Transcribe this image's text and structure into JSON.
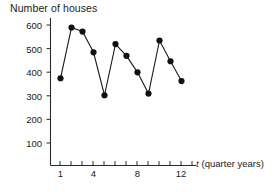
{
  "chart_data": {
    "type": "line",
    "title": "Number of houses",
    "xlabel": "t (quarter years)",
    "xlabel_variable": "t",
    "xlabel_unit": "(quarter years)",
    "ylabel": "Number of houses",
    "x": [
      1,
      2,
      3,
      4,
      5,
      6,
      7,
      8,
      9,
      10,
      11,
      12
    ],
    "values": [
      365,
      580,
      563,
      475,
      293,
      510,
      460,
      390,
      300,
      525,
      437,
      353
    ],
    "xlim": [
      0,
      13
    ],
    "ylim": [
      0,
      640
    ],
    "xticks": [
      1,
      2,
      3,
      4,
      5,
      6,
      7,
      8,
      9,
      10,
      11,
      12,
      13
    ],
    "xtick_labels": [
      "1",
      "",
      "",
      "4",
      "",
      "",
      "",
      "8",
      "",
      "",
      "",
      "12",
      ""
    ],
    "yticks": [
      100,
      200,
      300,
      400,
      500,
      600
    ],
    "ytick_labels": [
      "100",
      "200",
      "300",
      "400",
      "500",
      "600"
    ],
    "grid": false,
    "legend": false,
    "marker": "filled-circle",
    "line_color": "#1a1a1a",
    "marker_color": "#111111",
    "axis_color": "#2b2b2b",
    "background": "#ffffff"
  }
}
